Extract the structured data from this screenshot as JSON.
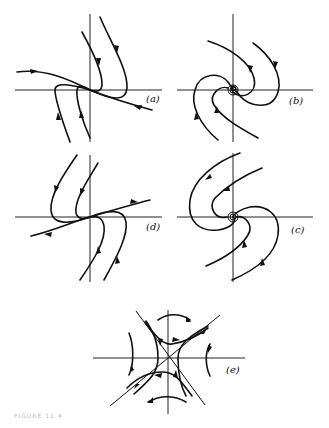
{
  "figure": {
    "panels": [
      {
        "id": "a",
        "label": "(a)",
        "type": "improper node (stable)"
      },
      {
        "id": "b",
        "label": "(b)",
        "type": "spiral (stable)"
      },
      {
        "id": "d",
        "label": "(d)",
        "type": "improper node (unstable)"
      },
      {
        "id": "c",
        "label": "(c)",
        "type": "spiral (unstable)"
      },
      {
        "id": "e",
        "label": "(e)",
        "type": "saddle point"
      }
    ],
    "caption": "FIGURE 11.4"
  }
}
